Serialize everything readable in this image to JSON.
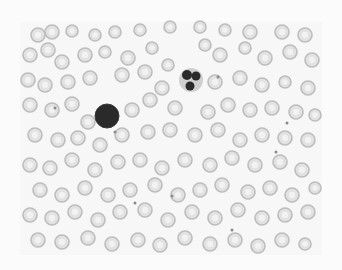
{
  "image": {
    "subject": "peripheral blood smear micrograph (grayscale)",
    "background": "#fbfbfb",
    "field": {
      "x": 20,
      "y": 22,
      "w": 302,
      "h": 233,
      "color": "#f7f7f7"
    },
    "colors": {
      "rbc_rim": "#bdbdbd",
      "rbc_fill": "#e2e2e2",
      "rbc_center": "#f2f2f2",
      "nucleus": "#2a2a2a",
      "cytoplasm": "#cfcfcf",
      "platelet": "#8a8a8a"
    }
  },
  "lymphocyte": {
    "cx": 107,
    "cy": 116,
    "r": 12
  },
  "neutrophil": {
    "cx": 191,
    "cy": 80,
    "r": 12,
    "lobes": [
      [
        187,
        75,
        5
      ],
      [
        196,
        76,
        4.5
      ],
      [
        190,
        86,
        4.5
      ]
    ]
  },
  "rbcs": [
    [
      38,
      35,
      7
    ],
    [
      52,
      32,
      7
    ],
    [
      72,
      31,
      6
    ],
    [
      95,
      35,
      6
    ],
    [
      115,
      32,
      6
    ],
    [
      140,
      30,
      6
    ],
    [
      170,
      27,
      6
    ],
    [
      200,
      27,
      6
    ],
    [
      225,
      30,
      6
    ],
    [
      250,
      32,
      7
    ],
    [
      282,
      32,
      7
    ],
    [
      305,
      35,
      7
    ],
    [
      30,
      55,
      7
    ],
    [
      48,
      50,
      7
    ],
    [
      62,
      62,
      7
    ],
    [
      85,
      55,
      7
    ],
    [
      105,
      52,
      6
    ],
    [
      128,
      58,
      7
    ],
    [
      152,
      48,
      6
    ],
    [
      168,
      65,
      6
    ],
    [
      205,
      45,
      6
    ],
    [
      220,
      55,
      7
    ],
    [
      245,
      48,
      6
    ],
    [
      265,
      58,
      7
    ],
    [
      290,
      52,
      7
    ],
    [
      312,
      60,
      7
    ],
    [
      28,
      80,
      7
    ],
    [
      45,
      85,
      7
    ],
    [
      68,
      82,
      7
    ],
    [
      90,
      78,
      7
    ],
    [
      122,
      75,
      7
    ],
    [
      145,
      72,
      7
    ],
    [
      162,
      88,
      7
    ],
    [
      215,
      82,
      7
    ],
    [
      240,
      78,
      7
    ],
    [
      262,
      85,
      7
    ],
    [
      285,
      82,
      6
    ],
    [
      308,
      88,
      7
    ],
    [
      30,
      105,
      7
    ],
    [
      52,
      110,
      7
    ],
    [
      72,
      104,
      7
    ],
    [
      88,
      122,
      7
    ],
    [
      132,
      110,
      7
    ],
    [
      150,
      100,
      7
    ],
    [
      175,
      108,
      7
    ],
    [
      208,
      112,
      7
    ],
    [
      228,
      105,
      7
    ],
    [
      250,
      110,
      7
    ],
    [
      272,
      108,
      7
    ],
    [
      296,
      112,
      7
    ],
    [
      315,
      115,
      6
    ],
    [
      35,
      135,
      7
    ],
    [
      58,
      140,
      7
    ],
    [
      78,
      138,
      7
    ],
    [
      100,
      145,
      7
    ],
    [
      122,
      135,
      7
    ],
    [
      148,
      132,
      7
    ],
    [
      170,
      130,
      7
    ],
    [
      195,
      135,
      7
    ],
    [
      218,
      130,
      7
    ],
    [
      240,
      140,
      7
    ],
    [
      262,
      135,
      7
    ],
    [
      285,
      138,
      7
    ],
    [
      308,
      140,
      7
    ],
    [
      30,
      165,
      7
    ],
    [
      50,
      168,
      7
    ],
    [
      72,
      160,
      7
    ],
    [
      95,
      170,
      7
    ],
    [
      118,
      162,
      7
    ],
    [
      140,
      160,
      7
    ],
    [
      162,
      168,
      7
    ],
    [
      185,
      160,
      7
    ],
    [
      210,
      165,
      7
    ],
    [
      232,
      158,
      7
    ],
    [
      255,
      165,
      7
    ],
    [
      280,
      162,
      7
    ],
    [
      302,
      170,
      7
    ],
    [
      40,
      190,
      7
    ],
    [
      62,
      195,
      7
    ],
    [
      85,
      188,
      7
    ],
    [
      108,
      195,
      7
    ],
    [
      130,
      190,
      7
    ],
    [
      155,
      185,
      7
    ],
    [
      178,
      195,
      7
    ],
    [
      200,
      190,
      7
    ],
    [
      222,
      185,
      7
    ],
    [
      248,
      192,
      7
    ],
    [
      270,
      188,
      7
    ],
    [
      292,
      195,
      7
    ],
    [
      315,
      188,
      6
    ],
    [
      30,
      215,
      7
    ],
    [
      52,
      218,
      7
    ],
    [
      75,
      212,
      7
    ],
    [
      98,
      220,
      7
    ],
    [
      120,
      212,
      7
    ],
    [
      145,
      210,
      7
    ],
    [
      168,
      220,
      7
    ],
    [
      192,
      212,
      7
    ],
    [
      215,
      218,
      7
    ],
    [
      238,
      210,
      7
    ],
    [
      262,
      218,
      7
    ],
    [
      285,
      215,
      7
    ],
    [
      308,
      212,
      7
    ],
    [
      38,
      240,
      7
    ],
    [
      62,
      242,
      7
    ],
    [
      88,
      238,
      7
    ],
    [
      112,
      244,
      7
    ],
    [
      138,
      240,
      7
    ],
    [
      160,
      245,
      7
    ],
    [
      185,
      238,
      7
    ],
    [
      210,
      244,
      7
    ],
    [
      235,
      240,
      7
    ],
    [
      258,
      246,
      7
    ],
    [
      282,
      240,
      7
    ],
    [
      305,
      244,
      6
    ]
  ],
  "platelets": [
    [
      55,
      108,
      1.5
    ],
    [
      115,
      132,
      1.5
    ],
    [
      218,
      77,
      1.5
    ],
    [
      287,
      123,
      1.5
    ],
    [
      276,
      152,
      1.5
    ],
    [
      172,
      196,
      1.5
    ],
    [
      232,
      230,
      1.5
    ],
    [
      135,
      203,
      1.5
    ]
  ]
}
